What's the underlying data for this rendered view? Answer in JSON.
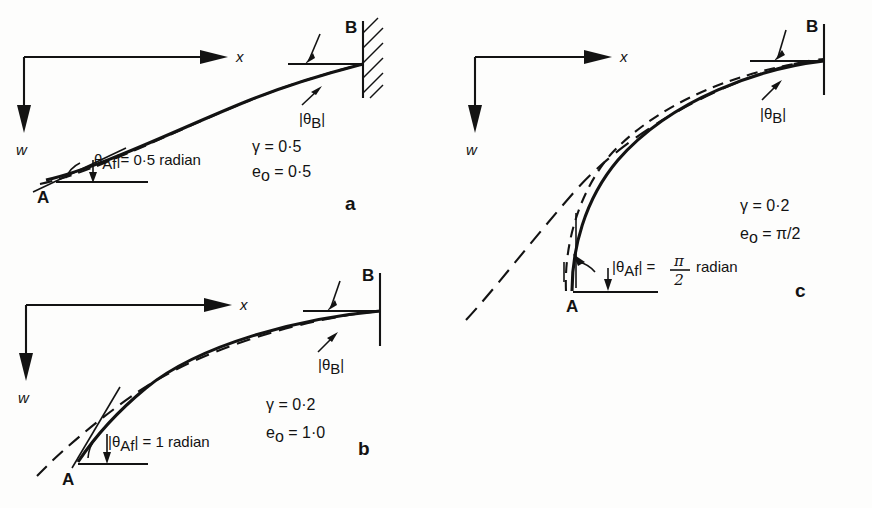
{
  "figure": {
    "caption_letters": {
      "a": "a",
      "b": "b",
      "c": "c"
    },
    "axis": {
      "x_label": "x",
      "w_label": "w"
    },
    "nodes": {
      "a": "A",
      "b": "B"
    },
    "theta_b_label": {
      "bar_left": "|",
      "symbol": "θ",
      "sub": "B",
      "bar_right": "|"
    },
    "theta_af_label": {
      "bar_left": "|",
      "symbol": "θ",
      "sub": "Af",
      "bar_right": "|",
      "equals": "="
    }
  },
  "panels": [
    {
      "id": "a",
      "letter": "a",
      "has_wall_hatching": true,
      "curves": [
        "solid",
        "long-dash"
      ],
      "theta_af_value": "0·5 radian",
      "theta_af_is_fraction": false,
      "params": [
        {
          "symbol": "γ",
          "sub": "",
          "equals": "=",
          "value": "0·5"
        },
        {
          "symbol": "e",
          "sub": "o",
          "equals": "=",
          "value": "0·5"
        }
      ]
    },
    {
      "id": "b",
      "letter": "b",
      "has_wall_hatching": false,
      "curves": [
        "solid",
        "long-dash"
      ],
      "theta_af_value": "1 radian",
      "theta_af_is_fraction": false,
      "params": [
        {
          "symbol": "γ",
          "sub": "",
          "equals": "=",
          "value": "0·2"
        },
        {
          "symbol": "e",
          "sub": "o",
          "equals": "=",
          "value": "1·0"
        }
      ]
    },
    {
      "id": "c",
      "letter": "c",
      "has_wall_hatching": false,
      "curves": [
        "solid",
        "short-dash",
        "long-dash"
      ],
      "theta_af_numerator": "π",
      "theta_af_denominator": "2",
      "theta_af_unit": "radian",
      "theta_af_is_fraction": true,
      "params": [
        {
          "symbol": "γ",
          "sub": "",
          "equals": "=",
          "value": "0·2"
        },
        {
          "symbol": "e",
          "sub": "o",
          "equals": "=",
          "value": "π/2"
        }
      ]
    }
  ]
}
